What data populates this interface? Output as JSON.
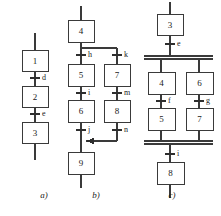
{
  "figure": {
    "background_color": "#ffffff",
    "line_color": "#3a3a3a",
    "text_color": "#1a1a1a",
    "width": 221,
    "height": 216
  },
  "panels": [
    {
      "id": "a",
      "caption": "a)",
      "caption_x": 44,
      "caption_y": 196,
      "structure": "linear-sequence",
      "steps": [
        {
          "label": "1",
          "x": 22,
          "y": 50,
          "w": 26,
          "h": 21
        },
        {
          "label": "2",
          "x": 22,
          "y": 86,
          "w": 26,
          "h": 21
        },
        {
          "label": "3",
          "x": 22,
          "y": 122,
          "w": 26,
          "h": 21
        }
      ],
      "transitions": [
        {
          "label": "d",
          "x": 35,
          "y": 78,
          "label_x": 41,
          "label_y": 78
        },
        {
          "label": "e",
          "x": 35,
          "y": 114,
          "label_x": 41,
          "label_y": 114
        }
      ],
      "entry_line": {
        "x": 35,
        "y1": 33,
        "y2": 50
      },
      "exit_line": {
        "x": 35,
        "y1": 143,
        "y2": 160
      }
    },
    {
      "id": "b",
      "caption": "b)",
      "caption_x": 96,
      "caption_y": 196,
      "structure": "alternative-branch",
      "steps": [
        {
          "label": "4",
          "x": 68,
          "y": 20,
          "w": 26,
          "h": 22
        },
        {
          "label": "5",
          "x": 68,
          "y": 64,
          "w": 26,
          "h": 22
        },
        {
          "label": "7",
          "x": 104,
          "y": 64,
          "w": 26,
          "h": 22
        },
        {
          "label": "6",
          "x": 68,
          "y": 100,
          "w": 26,
          "h": 22
        },
        {
          "label": "8",
          "x": 104,
          "y": 100,
          "w": 26,
          "h": 22
        },
        {
          "label": "9",
          "x": 68,
          "y": 152,
          "w": 26,
          "h": 22
        }
      ],
      "transitions": [
        {
          "label": "h",
          "x": 81,
          "y": 55,
          "label_x": 86,
          "label_y": 55
        },
        {
          "label": "k",
          "x": 117,
          "y": 55,
          "label_x": 122,
          "label_y": 55
        },
        {
          "label": "i",
          "x": 81,
          "y": 93,
          "label_x": 86,
          "label_y": 93
        },
        {
          "label": "m",
          "x": 117,
          "y": 93,
          "label_x": 122,
          "label_y": 93
        },
        {
          "label": "j",
          "x": 81,
          "y": 130,
          "label_x": 86,
          "label_y": 130
        },
        {
          "label": "n",
          "x": 117,
          "y": 130,
          "label_x": 122,
          "label_y": 130
        }
      ],
      "entry_line": {
        "x": 81,
        "y1": 6,
        "y2": 20
      },
      "exit_line": {
        "x": 81,
        "y1": 174,
        "y2": 188
      },
      "split_line": {
        "y": 48,
        "x1": 81,
        "x2": 117
      },
      "merge_line": {
        "y": 141,
        "x1": 81,
        "x2": 117
      },
      "merge_arrow": {
        "x": 92,
        "y": 141,
        "direction": "left"
      }
    },
    {
      "id": "c",
      "caption": "c)",
      "caption_x": 172,
      "caption_y": 196,
      "structure": "parallel-branch",
      "steps": [
        {
          "label": "3",
          "x": 157,
          "y": 14,
          "w": 26,
          "h": 21
        },
        {
          "label": "4",
          "x": 148,
          "y": 72,
          "w": 27,
          "h": 22
        },
        {
          "label": "6",
          "x": 186,
          "y": 72,
          "w": 27,
          "h": 22
        },
        {
          "label": "5",
          "x": 148,
          "y": 108,
          "w": 27,
          "h": 22
        },
        {
          "label": "7",
          "x": 186,
          "y": 108,
          "w": 27,
          "h": 22
        },
        {
          "label": "8",
          "x": 157,
          "y": 162,
          "w": 27,
          "h": 22
        }
      ],
      "transitions": [
        {
          "label": "e",
          "x": 170,
          "y": 44,
          "label_x": 176,
          "label_y": 44
        },
        {
          "label": "f",
          "x": 161,
          "y": 101,
          "label_x": 167,
          "label_y": 101
        },
        {
          "label": "g",
          "x": 199,
          "y": 101,
          "label_x": 205,
          "label_y": 101
        },
        {
          "label": "i",
          "x": 170,
          "y": 154,
          "label_x": 176,
          "label_y": 154
        }
      ],
      "entry_line": {
        "x": 170,
        "y1": 2,
        "y2": 14
      },
      "exit_line": {
        "x": 170,
        "y1": 184,
        "y2": 198
      },
      "fork_bar": {
        "y": 57,
        "x1": 144,
        "x2": 213,
        "double": true
      },
      "join_bar": {
        "y": 142,
        "x1": 144,
        "x2": 213,
        "double": true
      }
    }
  ]
}
